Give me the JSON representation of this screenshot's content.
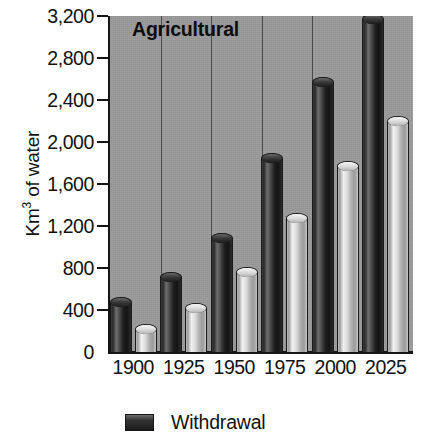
{
  "chart_data": {
    "type": "bar",
    "title": "Agricultural",
    "xlabel": "",
    "ylabel": "Km3 of water",
    "ylabel_base": "Km",
    "ylabel_sup": "3",
    "ylabel_tail": " of water",
    "categories": [
      "1900",
      "1925",
      "1950",
      "1975",
      "2000",
      "2025"
    ],
    "ylim": [
      0,
      3200
    ],
    "ytick_values": [
      0,
      400,
      800,
      1200,
      1600,
      2000,
      2400,
      2800,
      3200
    ],
    "ytick_labels": [
      "0",
      "400",
      "800",
      "1,200",
      "1,600",
      "2,000",
      "2,400",
      "2,800",
      "3,200"
    ],
    "grid": false,
    "legend_position": "bottom",
    "series": [
      {
        "name": "Withdrawal",
        "color": "#2a2a2a",
        "values": [
          520,
          760,
          1130,
          1900,
          2620,
          3220
        ]
      },
      {
        "name": "",
        "color": "#dcdcdc",
        "values": [
          270,
          470,
          810,
          1320,
          1820,
          2250
        ]
      }
    ],
    "annotations": []
  },
  "legend": {
    "items": [
      {
        "label": "Withdrawal",
        "swatch": "#2a2a2a"
      }
    ]
  },
  "colors": {
    "plot_background": "#9b9b9b",
    "page_background": "#ffffff",
    "axis": "#141414",
    "text": "#111111"
  }
}
